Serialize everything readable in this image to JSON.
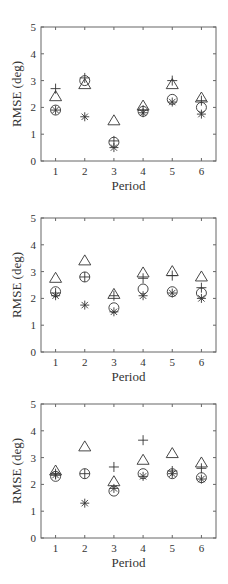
{
  "chart_data": [
    {
      "type": "scatter",
      "title": "",
      "xlabel": "Period",
      "ylabel": "RMSE (deg)",
      "x": [
        1,
        2,
        3,
        4,
        5,
        6
      ],
      "xticks": [
        "1",
        "2",
        "3",
        "4",
        "5",
        "6"
      ],
      "yticks": [
        "0",
        "1",
        "2",
        "3",
        "4",
        "5"
      ],
      "ylim": [
        0,
        5
      ],
      "xlim": [
        0.5,
        6.5
      ],
      "grid": false,
      "legend": null,
      "series": [
        {
          "name": "plus",
          "marker": "+",
          "values": [
            2.7,
            3.1,
            0.75,
            1.9,
            3.0,
            2.25
          ]
        },
        {
          "name": "triangle",
          "marker": "△",
          "values": [
            2.4,
            2.85,
            1.5,
            2.05,
            2.85,
            2.35
          ]
        },
        {
          "name": "circle",
          "marker": "○",
          "values": [
            1.9,
            3.0,
            0.7,
            1.85,
            2.3,
            2.0
          ]
        },
        {
          "name": "asterisk",
          "marker": "*",
          "values": [
            1.9,
            1.65,
            0.5,
            1.8,
            2.2,
            1.75
          ]
        }
      ]
    },
    {
      "type": "scatter",
      "title": "",
      "xlabel": "Period",
      "ylabel": "RMSE (deg)",
      "x": [
        1,
        2,
        3,
        4,
        5,
        6
      ],
      "xticks": [
        "1",
        "2",
        "3",
        "4",
        "5",
        "6"
      ],
      "yticks": [
        "0",
        "1",
        "2",
        "3",
        "4",
        "5"
      ],
      "ylim": [
        0,
        5
      ],
      "xlim": [
        0.5,
        6.5
      ],
      "grid": false,
      "legend": null,
      "series": [
        {
          "name": "plus",
          "marker": "+",
          "values": [
            2.2,
            2.8,
            2.1,
            2.75,
            2.85,
            2.4
          ]
        },
        {
          "name": "triangle",
          "marker": "△",
          "values": [
            2.75,
            3.4,
            2.15,
            2.95,
            3.0,
            2.8
          ]
        },
        {
          "name": "circle",
          "marker": "○",
          "values": [
            2.25,
            2.8,
            1.65,
            2.35,
            2.25,
            2.2
          ]
        },
        {
          "name": "asterisk",
          "marker": "*",
          "values": [
            2.1,
            1.75,
            1.5,
            2.1,
            2.2,
            2.0
          ]
        }
      ]
    },
    {
      "type": "scatter",
      "title": "",
      "xlabel": "Period",
      "ylabel": "RMSE (deg)",
      "x": [
        1,
        2,
        3,
        4,
        5,
        6
      ],
      "xticks": [
        "1",
        "2",
        "3",
        "4",
        "5",
        "6"
      ],
      "yticks": [
        "0",
        "1",
        "2",
        "3",
        "4",
        "5"
      ],
      "ylim": [
        0,
        5
      ],
      "xlim": [
        0.5,
        6.5
      ],
      "grid": false,
      "legend": null,
      "series": [
        {
          "name": "plus",
          "marker": "+",
          "values": [
            2.4,
            2.4,
            2.65,
            3.65,
            2.5,
            2.6
          ]
        },
        {
          "name": "triangle",
          "marker": "△",
          "values": [
            2.5,
            3.4,
            2.1,
            2.9,
            3.15,
            2.8
          ]
        },
        {
          "name": "circle",
          "marker": "○",
          "values": [
            2.3,
            2.4,
            1.75,
            2.4,
            2.4,
            2.25
          ]
        },
        {
          "name": "asterisk",
          "marker": "*",
          "values": [
            2.35,
            1.3,
            1.85,
            2.3,
            2.4,
            2.2
          ]
        }
      ]
    }
  ],
  "style": {
    "axis_color": "#666666",
    "marker_color": "#333333",
    "background": "#ffffff"
  },
  "plots_layout": [
    {
      "top": 27,
      "bottom": 161
    },
    {
      "top": 218,
      "bottom": 352
    },
    {
      "top": 404,
      "bottom": 538
    }
  ]
}
